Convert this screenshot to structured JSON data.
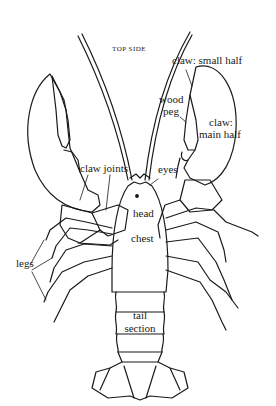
{
  "diagram": {
    "view_label": "TOP SIDE",
    "labels": {
      "claw_small_half": "claw: small half",
      "wood_peg_line1": "wood",
      "wood_peg_line2": "peg",
      "claw_main_half_line1": "claw:",
      "claw_main_half_line2": "main half",
      "claw_joints": "claw joints",
      "eyes": "eyes",
      "head": "head",
      "chest": "chest",
      "legs": "legs",
      "tail_line1": "tail",
      "tail_line2": "section"
    },
    "colors": {
      "ink": "#1a1a1a",
      "background": "#ffffff"
    }
  }
}
